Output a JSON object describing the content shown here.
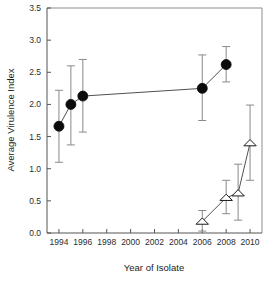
{
  "chart_data": {
    "type": "scatter",
    "title": "",
    "xlabel": "Year of Isolate",
    "ylabel": "Average Virulence Index",
    "xlim": [
      1993,
      2011
    ],
    "ylim": [
      0.0,
      3.5
    ],
    "grid": false,
    "legend": "none",
    "xticks": [
      1994,
      1996,
      1998,
      2000,
      2002,
      2004,
      2006,
      2008,
      2010
    ],
    "xtick_labels": [
      "1994",
      "1996",
      "1998",
      "2000",
      "2002",
      "2004",
      "2006",
      "2008",
      "2010"
    ],
    "yticks": [
      0.0,
      0.5,
      1.0,
      1.5,
      2.0,
      2.5,
      3.0,
      3.5
    ],
    "ytick_labels": [
      "0.0",
      "0.5",
      "1.0",
      "1.5",
      "2.0",
      "2.5",
      "3.0",
      "3.5"
    ],
    "series": [
      {
        "name": "filled-circle-series",
        "marker": "filled-circle",
        "color": "#0b0b0b",
        "connected": true,
        "points": [
          {
            "x": 1994,
            "y": 1.66,
            "lo": 1.1,
            "hi": 2.22
          },
          {
            "x": 1995,
            "y": 2.0,
            "lo": 1.37,
            "hi": 2.6
          },
          {
            "x": 1996,
            "y": 2.13,
            "lo": 1.57,
            "hi": 2.7
          },
          {
            "x": 2006,
            "y": 2.25,
            "lo": 1.75,
            "hi": 2.77
          },
          {
            "x": 2008,
            "y": 2.62,
            "lo": 2.35,
            "hi": 2.9
          }
        ]
      },
      {
        "name": "open-triangle-series",
        "marker": "open-triangle",
        "color": "#ffffff",
        "connected": true,
        "points": [
          {
            "x": 2006,
            "y": 0.18,
            "lo": 0.03,
            "hi": 0.35
          },
          {
            "x": 2008,
            "y": 0.55,
            "lo": 0.3,
            "hi": 0.82
          },
          {
            "x": 2009,
            "y": 0.62,
            "lo": 0.2,
            "hi": 1.07
          },
          {
            "x": 2010,
            "y": 1.4,
            "lo": 0.82,
            "hi": 1.99
          }
        ]
      }
    ]
  },
  "axes": {
    "x_title": "Year of Isolate",
    "y_title": "Average Virulence Index"
  }
}
